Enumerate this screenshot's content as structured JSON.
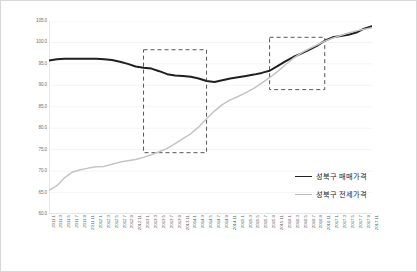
{
  "chart_data": {
    "type": "line",
    "title": "",
    "xlabel": "",
    "ylabel": "",
    "ylim": [
      60.0,
      105.0
    ],
    "ytick_step": 5.0,
    "grid": true,
    "legend_position": "right-inside",
    "ytick_labels": [
      "105.0",
      "100.0",
      "95.0",
      "90.0",
      "85.0",
      "80.0",
      "75.0",
      "70.0",
      "65.0",
      "60.0"
    ],
    "categories": [
      "2011.1",
      "2011.3",
      "2011.5",
      "2011.7",
      "2011.9",
      "2011.11",
      "2012.1",
      "2012.3",
      "2012.5",
      "2012.7",
      "2012.9",
      "2012.11",
      "2013.1",
      "2013.3",
      "2013.5",
      "2013.7",
      "2013.9",
      "2013.11",
      "2014.1",
      "2014.3",
      "2014.5",
      "2014.7",
      "2014.9",
      "2014.11",
      "2015.1",
      "2015.3",
      "2015.5",
      "2015.7",
      "2015.9",
      "2015.11",
      "2016.1",
      "2016.3",
      "2016.5",
      "2016.7",
      "2016.9",
      "2016.11",
      "2017.1",
      "2017.3",
      "2017.5",
      "2017.7",
      "2017.9",
      "2017.11"
    ],
    "series": [
      {
        "name": "성북구 매매가격",
        "color": "#1f1f1f",
        "style": "solid",
        "width": 2.0,
        "values": [
          95.8,
          96.1,
          96.2,
          96.2,
          96.2,
          96.2,
          96.2,
          96.1,
          95.9,
          95.5,
          95.0,
          94.4,
          94.1,
          93.9,
          93.3,
          92.6,
          92.3,
          92.2,
          92.0,
          91.6,
          91.0,
          90.8,
          91.2,
          91.6,
          91.9,
          92.2,
          92.5,
          92.9,
          93.4,
          94.5,
          95.6,
          96.6,
          97.4,
          98.3,
          99.2,
          100.4,
          101.2,
          101.5,
          101.8,
          102.3,
          103.2,
          103.8
        ]
      },
      {
        "name": "성북구 전세가격",
        "color": "#c4c4c4",
        "style": "solid",
        "width": 1.5,
        "values": [
          65.5,
          66.6,
          68.5,
          69.8,
          70.3,
          70.7,
          71.0,
          71.1,
          71.6,
          72.1,
          72.4,
          72.7,
          73.2,
          73.8,
          74.5,
          75.3,
          76.4,
          77.6,
          78.7,
          80.3,
          82.2,
          84.0,
          85.5,
          86.6,
          87.4,
          88.3,
          89.3,
          90.5,
          91.8,
          93.2,
          94.8,
          96.3,
          97.5,
          98.5,
          99.4,
          100.3,
          101.0,
          101.6,
          102.2,
          102.7,
          103.1,
          103.4
        ]
      }
    ],
    "annotations": [
      {
        "name": "highlight-box-1",
        "type": "dashed-rect",
        "color": "#555555",
        "x_start": "2013.1",
        "x_end": "2014.5",
        "y_top": 98.3,
        "y_bottom": 74.3
      },
      {
        "name": "highlight-box-2",
        "type": "dashed-rect",
        "color": "#555555",
        "x_start": "2015.9",
        "x_end": "2016.11",
        "y_top": 101.2,
        "y_bottom": 89.0
      }
    ]
  }
}
